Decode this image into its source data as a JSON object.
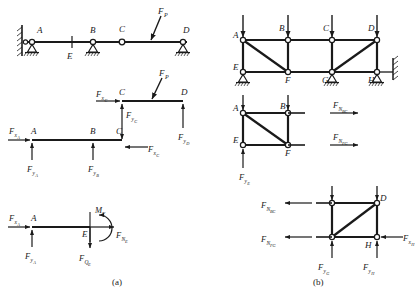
{
  "figure": {
    "caption_a": "(a)",
    "caption_b": "(b)"
  },
  "panel_a": {
    "name": "continuous-beam-with-hinge",
    "diagram_1": {
      "name": "overall-beam",
      "joints": [
        "A",
        "E",
        "B",
        "C",
        "D"
      ],
      "labels": {
        "A": "A",
        "E": "E",
        "B": "B",
        "C": "C",
        "D": "D",
        "load": "F",
        "load_sub": "P"
      },
      "supports": {
        "A": "pin-on-wall",
        "B": "pin-hatched",
        "C": "internal-hinge",
        "D": "pin-hatched"
      }
    },
    "diagram_2": {
      "name": "segment-CD-free-body",
      "labels": {
        "C": "C",
        "D": "D",
        "load": "F",
        "load_sub": "P",
        "fx_c": "F",
        "fx_c_sub": "x",
        "fx_c_sub2": "C",
        "fy_c": "F",
        "fy_c_sub": "y",
        "fy_c_sub2": "C",
        "fy_d": "F",
        "fy_d_sub": "y",
        "fy_d_sub2": "D"
      }
    },
    "diagram_3": {
      "name": "segment-ABC-free-body",
      "labels": {
        "A": "A",
        "B": "B",
        "C": "C",
        "fx_a": "F",
        "fx_a_sub": "x",
        "fx_a_sub2": "A",
        "fy_a": "F",
        "fy_a_sub": "y",
        "fy_a_sub2": "A",
        "fy_b": "F",
        "fy_b_sub": "y",
        "fy_b_sub2": "B",
        "fx_c": "F",
        "fx_c_sub": "x",
        "fx_c_sub2": "C"
      }
    },
    "diagram_4": {
      "name": "segment-AE-cut-free-body",
      "labels": {
        "A": "A",
        "E": "E",
        "fx_a": "F",
        "fx_a_sub": "x",
        "fx_a_sub2": "A",
        "fy_a": "F",
        "fy_a_sub": "y",
        "fy_a_sub2": "A",
        "moment": "M",
        "moment_sub": "E",
        "shear": "F",
        "shear_sub": "Q",
        "shear_sub2": "E",
        "axial": "F",
        "axial_sub": "N",
        "axial_sub2": "E"
      }
    }
  },
  "panel_b": {
    "name": "plane-truss",
    "diagram_1": {
      "name": "overall-truss",
      "top_nodes": [
        "A",
        "B",
        "C",
        "D"
      ],
      "bottom_nodes": [
        "E",
        "F",
        "G",
        "H"
      ],
      "diagonals": [
        "A-F",
        "G-D"
      ],
      "loads_at": [
        "A",
        "B",
        "C",
        "D"
      ],
      "supports": {
        "E": "pin-hatched",
        "G": "pin-hatched",
        "H": "pin-hatched",
        "H_link": "horizontal-wall-link"
      }
    },
    "diagram_2": {
      "name": "truss-left-section-free-body",
      "nodes": [
        "A",
        "B",
        "E",
        "F"
      ],
      "labels": {
        "A": "A",
        "B": "B",
        "E": "E",
        "F": "F",
        "n_bc": "F",
        "n_bc_sub": "N",
        "n_bc_sub2": "BC",
        "n_fg": "F",
        "n_fg_sub": "N",
        "n_fg_sub2": "FG",
        "fy_e": "F",
        "fy_e_sub": "y",
        "fy_e_sub2": "E"
      }
    },
    "diagram_3": {
      "name": "truss-right-section-free-body",
      "nodes": [
        "C",
        "D",
        "G",
        "H"
      ],
      "labels": {
        "D": "D",
        "H": "H",
        "n_bc": "F",
        "n_bc_sub": "N",
        "n_bc_sub2": "BC",
        "n_fg": "F",
        "n_fg_sub": "N",
        "n_fg_sub2": "FG",
        "fy_g": "F",
        "fy_g_sub": "y",
        "fy_g_sub2": "G",
        "fy_h": "F",
        "fy_h_sub": "y",
        "fy_h_sub2": "H",
        "fx_h": "F",
        "fx_h_sub": "x",
        "fx_h_sub2": "H"
      }
    }
  }
}
